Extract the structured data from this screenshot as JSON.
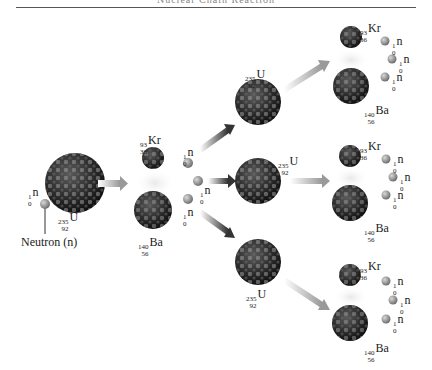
{
  "header": {
    "title": "Nuclear Chain Reaction"
  },
  "colors": {
    "nucleus_dark": "#2a2a2a",
    "nucleus_light": "#b5b5b5",
    "neutron": "#8c8c8c",
    "arrow": "#4a4a4a",
    "rule": "#555555"
  },
  "labels": {
    "neutron_caption": "Neutron (n)",
    "neutron": {
      "mass": "1",
      "atomic": "0",
      "symbol": "n"
    },
    "uranium": {
      "mass": "235",
      "atomic": "92",
      "symbol": "U"
    },
    "krypton": {
      "mass": "93",
      "atomic": "36",
      "symbol": "Kr"
    },
    "barium": {
      "mass": "140",
      "atomic": "56",
      "symbol": "Ba"
    }
  },
  "stages": [
    {
      "name": "initial",
      "items": [
        "neutron",
        "uranium-235"
      ]
    },
    {
      "name": "first-fission",
      "products": [
        "krypton-93",
        "barium-140"
      ],
      "released_neutrons": 3
    },
    {
      "name": "second-generation",
      "items": [
        "uranium-235",
        "uranium-235",
        "uranium-235"
      ]
    },
    {
      "name": "second-fission",
      "branches": 3,
      "products_per_branch": [
        "krypton-93",
        "barium-140"
      ],
      "released_neutrons_per_branch": 3
    }
  ]
}
